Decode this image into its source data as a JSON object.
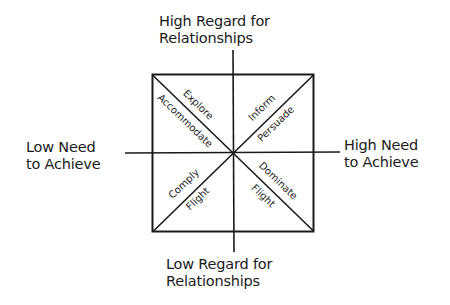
{
  "diagram": {
    "title": "",
    "axes": {
      "top": {
        "line1": "High Regard for",
        "line2": "Relationships"
      },
      "bottom": {
        "line1": "Low Regard for",
        "line2": "Relationships"
      },
      "left": {
        "line1": "Low Need",
        "line2": "to Achieve"
      },
      "right": {
        "line1": "High Need",
        "line2": "to Achieve"
      }
    },
    "segments": {
      "top_left": {
        "outer": "Explore",
        "inner": "Accommodate"
      },
      "top_right": {
        "outer": "Inform",
        "inner": "Persuade"
      },
      "bottom_left": {
        "outer": "Comply",
        "inner": "Flight"
      },
      "bottom_right": {
        "outer": "Dominate",
        "inner": "Flight"
      }
    },
    "colors": {
      "line": "#1a1a1a",
      "background": "#ffffff"
    }
  }
}
